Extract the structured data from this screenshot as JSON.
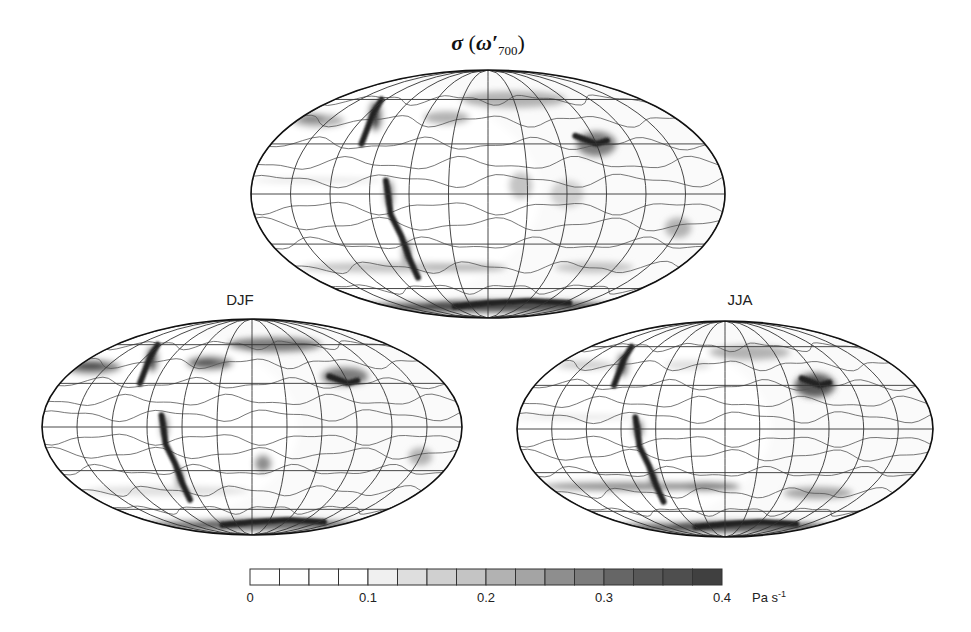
{
  "figure": {
    "title_sigma": "σ",
    "title_open": " (",
    "title_omega": "ω′",
    "title_sub": "700",
    "title_close": ")"
  },
  "chart_data": [
    {
      "type": "heatmap",
      "panel": "annual",
      "title": "σ (ω′700)",
      "label": "",
      "projection": "Mollweide (global, centered on Americas)",
      "field": "standard deviation of 700 hPa vertical velocity",
      "features": [
        {
          "region": "North Pacific storm track",
          "level": 0.25
        },
        {
          "region": "North Atlantic storm track",
          "level": 0.2
        },
        {
          "region": "Rockies / Andes topography",
          "level": 0.4
        },
        {
          "region": "Himalaya / Tibet",
          "level": 0.35
        },
        {
          "region": "Southern Ocean storm track",
          "level": 0.2
        },
        {
          "region": "Antarctic coast",
          "level": 0.4
        },
        {
          "region": "Subtropical subsidence zones",
          "level": 0.05
        },
        {
          "region": "ITCZ",
          "level": 0.15
        }
      ]
    },
    {
      "type": "heatmap",
      "panel": "DJF",
      "label": "DJF",
      "projection": "Mollweide (global, centered on Americas)",
      "features": [
        {
          "region": "North Pacific storm track",
          "level": 0.35
        },
        {
          "region": "North Atlantic storm track",
          "level": 0.3
        },
        {
          "region": "Rockies / Andes topography",
          "level": 0.4
        },
        {
          "region": "Southern Ocean storm track",
          "level": 0.15
        },
        {
          "region": "Subtropical subsidence zones",
          "level": 0.05
        }
      ]
    },
    {
      "type": "heatmap",
      "panel": "JJA",
      "label": "JJA",
      "projection": "Mollweide (global, centered on Americas)",
      "features": [
        {
          "region": "North Pacific storm track",
          "level": 0.15
        },
        {
          "region": "Asian monsoon / Tibet",
          "level": 0.35
        },
        {
          "region": "Southern Ocean storm track",
          "level": 0.25
        },
        {
          "region": "Andes topography",
          "level": 0.4
        },
        {
          "region": "Antarctic coast",
          "level": 0.4
        },
        {
          "region": "Subtropical subsidence zones",
          "level": 0.05
        }
      ]
    }
  ],
  "colorbar": {
    "min": 0,
    "max": 0.4,
    "n_levels": 16,
    "step": 0.025,
    "ticks": [
      "0",
      "0.1",
      "0.2",
      "0.3",
      "0.4"
    ],
    "tick_values": [
      0,
      0.1,
      0.2,
      0.3,
      0.4
    ],
    "unit_main": "Pa s",
    "unit_sup": "-1",
    "colors": [
      "#ffffff",
      "#ffffff",
      "#ffffff",
      "#ffffff",
      "#f0f0f0",
      "#dedede",
      "#d0d0d0",
      "#c4c4c4",
      "#b2b2b2",
      "#a4a4a4",
      "#8e8e8e",
      "#7c7c7c",
      "#666666",
      "#585858",
      "#4e4e4e",
      "#404040"
    ]
  }
}
